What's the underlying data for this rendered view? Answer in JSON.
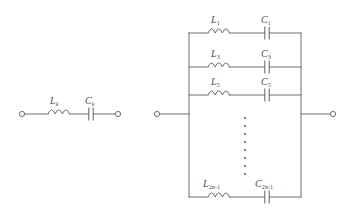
{
  "figure": {
    "kind": "electrical-circuit-diagram",
    "background_color": "#ffffff",
    "line_color": "#6e6e6e",
    "label_color": "#4d4d4d",
    "width": 354,
    "height": 220
  },
  "left_circuit": {
    "name": "single series LC branch",
    "inductor_label": "L",
    "inductor_subscript": "k",
    "capacitor_label": "C",
    "capacitor_subscript": "k",
    "terminal_count": 2
  },
  "right_circuit": {
    "name": "parallel network of series LC branches",
    "terminal_count": 2,
    "branches": [
      {
        "inductor_label": "L",
        "inductor_subscript": "1",
        "capacitor_label": "C",
        "capacitor_subscript": "1"
      },
      {
        "inductor_label": "L",
        "inductor_subscript": "3",
        "capacitor_label": "C",
        "capacitor_subscript": "3"
      },
      {
        "inductor_label": "L",
        "inductor_subscript": "5",
        "capacitor_label": "C",
        "capacitor_subscript": "5"
      },
      {
        "inductor_label": "L",
        "inductor_subscript": "2n-1",
        "capacitor_label": "C",
        "capacitor_subscript": "2n-1"
      }
    ],
    "ellipsis": "vertical dots indicating omitted branches",
    "ellipsis_dot_count": 8
  }
}
